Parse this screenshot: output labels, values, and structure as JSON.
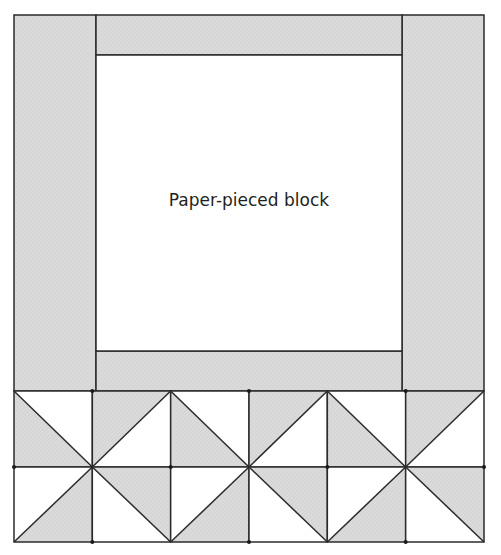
{
  "diagram": {
    "center_block": {
      "label": "Paper-pieced block"
    },
    "colors": {
      "fabric_gray": "#d9d9d9",
      "background": "#ffffff",
      "outline": "#2b2b2b"
    },
    "layout": {
      "outer": {
        "left": 14,
        "top": 15,
        "right": 484,
        "bottom": 542
      },
      "inner": {
        "left": 96,
        "right": 402,
        "top_strip_bottom": 55,
        "bottom_strip_top": 351
      },
      "hst_rows_top": 391,
      "hst_rows_mid": 467
    },
    "borders": [
      {
        "name": "left-side-strip",
        "fill": "gray"
      },
      {
        "name": "right-side-strip",
        "fill": "gray"
      },
      {
        "name": "top-strip",
        "fill": "gray"
      },
      {
        "name": "bottom-strip",
        "fill": "gray"
      }
    ],
    "hst_rows": [
      {
        "row": 1,
        "cells": [
          {
            "diagonal": "tl-br",
            "shaded": "lower-left"
          },
          {
            "diagonal": "bl-tr",
            "shaded": "upper-left"
          },
          {
            "diagonal": "tl-br",
            "shaded": "lower-left"
          },
          {
            "diagonal": "bl-tr",
            "shaded": "upper-left"
          },
          {
            "diagonal": "tl-br",
            "shaded": "lower-left"
          },
          {
            "diagonal": "bl-tr",
            "shaded": "upper-left"
          }
        ]
      },
      {
        "row": 2,
        "cells": [
          {
            "diagonal": "bl-tr",
            "shaded": "lower-right"
          },
          {
            "diagonal": "tl-br",
            "shaded": "upper-right"
          },
          {
            "diagonal": "bl-tr",
            "shaded": "lower-right"
          },
          {
            "diagonal": "tl-br",
            "shaded": "upper-right"
          },
          {
            "diagonal": "bl-tr",
            "shaded": "lower-right"
          },
          {
            "diagonal": "tl-br",
            "shaded": "upper-right"
          }
        ]
      }
    ]
  }
}
